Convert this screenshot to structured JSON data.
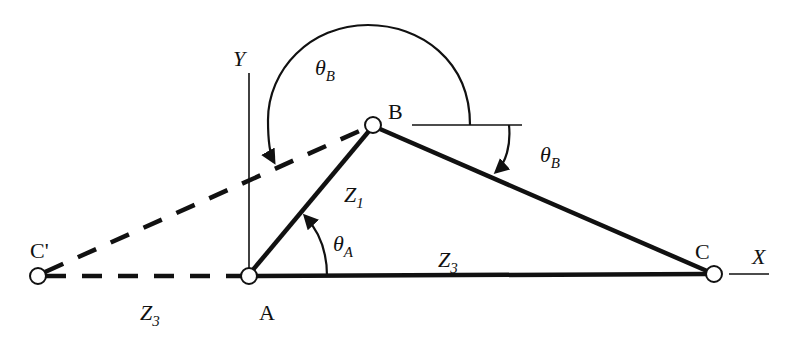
{
  "diagram": {
    "type": "four-bar linkage geometry (triangle ABC)",
    "colors": {
      "ink": "#111111",
      "background": "#ffffff",
      "pin_fill": "#ffffff"
    },
    "axes": {
      "x_label": "X",
      "y_label": "Y"
    },
    "points": {
      "A": {
        "label": "A",
        "x": 249,
        "y": 276
      },
      "B": {
        "label": "B",
        "x": 373,
        "y": 125
      },
      "C": {
        "label": "C",
        "x": 714,
        "y": 274
      },
      "C_prime": {
        "label": "C'",
        "x": 38,
        "y": 276
      }
    },
    "links": {
      "Z1": {
        "label": "Z",
        "sub": "1",
        "from": "A",
        "to": "B",
        "style": "solid"
      },
      "Z3": {
        "label": "Z",
        "sub": "3",
        "from": "A",
        "to": "C",
        "style": "solid"
      },
      "Z3_prime": {
        "label": "Z",
        "sub": "3",
        "from": "A",
        "to": "C'",
        "style": "dashed"
      },
      "BC": {
        "from": "B",
        "to": "C",
        "style": "solid"
      },
      "BC_prime": {
        "from": "B",
        "to": "C'",
        "style": "dashed"
      }
    },
    "angles": {
      "theta_A": {
        "symbol": "θ",
        "sub": "A",
        "description": "angle of Z1 from X axis at A"
      },
      "theta_B_upper": {
        "symbol": "θ",
        "sub": "B",
        "description": "large arc angle at B measured to BC'"
      },
      "theta_B_lower": {
        "symbol": "θ",
        "sub": "B",
        "description": "angle at B measured to BC"
      }
    }
  }
}
